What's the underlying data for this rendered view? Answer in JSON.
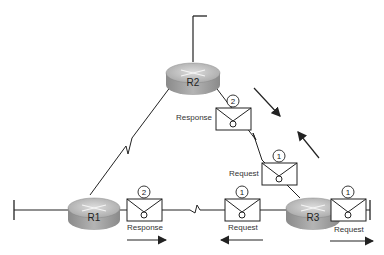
{
  "routers": [
    {
      "id": "r1",
      "label": "R1"
    },
    {
      "id": "r2",
      "label": "R2"
    },
    {
      "id": "r3",
      "label": "R3"
    }
  ],
  "messages": [
    {
      "id": "r2-response",
      "number": "2",
      "label": "Response"
    },
    {
      "id": "r3r2-request",
      "number": "1",
      "label": "Request"
    },
    {
      "id": "r1-response",
      "number": "2",
      "label": "Response"
    },
    {
      "id": "r3r1-request",
      "number": "1",
      "label": "Request"
    },
    {
      "id": "r3-out-request",
      "number": "1",
      "label": "Request"
    }
  ],
  "colors": {
    "line": "#222222",
    "router_top": "#c8c8c8",
    "router_side": "#9a9a9a"
  }
}
